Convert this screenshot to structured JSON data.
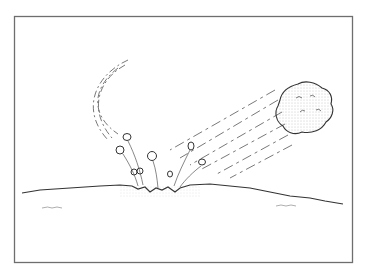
{
  "illustration": {
    "subject": "Meteorite striking the ground",
    "elements": [
      "frame",
      "meteorite",
      "motion-streaks",
      "arcing-trail",
      "ground-line",
      "impact-crater",
      "ejecta-debris",
      "ground-texture"
    ],
    "colors": {
      "ink": "#3a3a3a",
      "frame": "#6e6e6e",
      "stipple": "#9a9a9a",
      "background": "#ffffff"
    }
  }
}
